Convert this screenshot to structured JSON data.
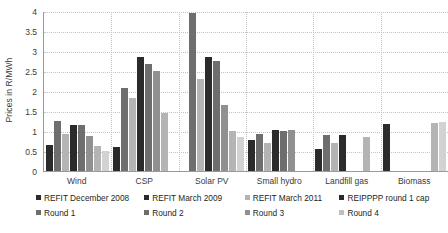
{
  "chart_data": {
    "type": "bar",
    "title": "",
    "xlabel": "",
    "ylabel": "Prices in R/MWh",
    "ylim": [
      0,
      4
    ],
    "ytick_step": 0.5,
    "yticks": [
      "4",
      "3.5",
      "3",
      "2.5",
      "2",
      "1.5",
      "1",
      "0.5",
      "0"
    ],
    "grid": true,
    "legend_position": "bottom",
    "categories": [
      "Wind",
      "CSP",
      "Solar PV",
      "Small hydro",
      "Landfill gas",
      "Biomass"
    ],
    "series": [
      {
        "name": "REFIT December 2008",
        "color": "#2b2b2b",
        "values": [
          0.65,
          0.61,
          null,
          0.78,
          0.55,
          1.18
        ]
      },
      {
        "name": "REFIT March 2009",
        "color": "#6e6e6e",
        "values": [
          1.25,
          2.08,
          3.94,
          0.92,
          0.9,
          null
        ]
      },
      {
        "name": "REFIT March 2011",
        "color": "#b4b4b4",
        "values": [
          0.93,
          1.83,
          2.3,
          0.7,
          0.7,
          null
        ]
      },
      {
        "name": "REIPPPP round 1 cap",
        "color": "#2b2b2b",
        "values": [
          1.15,
          2.85,
          2.85,
          1.03,
          0.9,
          null
        ]
      },
      {
        "name": "Round 1",
        "color": "#6e6e6e",
        "values": [
          1.14,
          2.68,
          2.75,
          1.0,
          null,
          null
        ]
      },
      {
        "name": "Round 2",
        "color": "#909090",
        "values": [
          0.88,
          2.5,
          1.65,
          1.02,
          null,
          null
        ]
      },
      {
        "name": "Round 3",
        "color": "#b4b4b4",
        "values": [
          0.63,
          1.45,
          1.0,
          null,
          0.85,
          1.2
        ]
      },
      {
        "name": "Round 4",
        "color": "#d2d2d2",
        "values": [
          0.51,
          null,
          0.85,
          null,
          null,
          1.22
        ]
      }
    ]
  },
  "axis": {
    "y_title": "Prices in R/MWh"
  },
  "legend": {
    "rows": [
      [
        {
          "label": "REFIT December 2008",
          "color": "#2b2b2b"
        },
        {
          "label": "REFIT March 2009",
          "color": "#2b2b2b"
        },
        {
          "label": "REFIT March 2011",
          "color": "#b4b4b4"
        },
        {
          "label": "REIPPPP round 1 cap",
          "color": "#2b2b2b"
        }
      ],
      [
        {
          "label": "Round 1",
          "color": "#6e6e6e"
        },
        {
          "label": "Round 2",
          "color": "#6e6e6e"
        },
        {
          "label": "Round 3",
          "color": "#909090"
        },
        {
          "label": "Round 4",
          "color": "#c0c0c0"
        }
      ]
    ]
  }
}
